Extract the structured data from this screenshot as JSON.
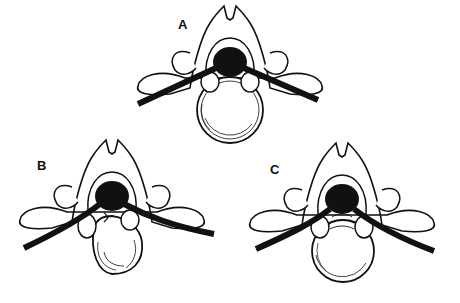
{
  "figure": {
    "panels": [
      {
        "id": "A",
        "label": "A",
        "description": "vertebra with nerve roots, disc intact"
      },
      {
        "id": "B",
        "label": "B",
        "description": "vertebra with disc herniation into nerve root region"
      },
      {
        "id": "C",
        "label": "C",
        "description": "vertebra with central disc bulge"
      }
    ],
    "colors": {
      "ink": "#111111",
      "background": "#ffffff"
    }
  }
}
